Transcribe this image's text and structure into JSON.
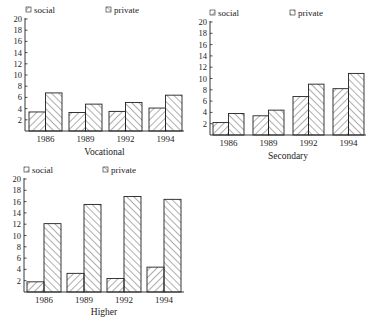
{
  "chart_data": [
    {
      "type": "bar",
      "title": "Vocational",
      "xlabel": "Vocational",
      "ylabel": "",
      "categories": [
        "1986",
        "1989",
        "1992",
        "1994"
      ],
      "series": [
        {
          "name": "social",
          "values": [
            3.4,
            3.3,
            3.5,
            4.1
          ]
        },
        {
          "name": "private",
          "values": [
            6.8,
            4.8,
            5.1,
            6.4
          ]
        }
      ],
      "ylim": [
        0,
        20
      ],
      "yticks": [
        2,
        4,
        6,
        8,
        10,
        12,
        14,
        16,
        18,
        20
      ],
      "legend": [
        "social",
        "private"
      ],
      "legend_position": "top",
      "grid": false
    },
    {
      "type": "bar",
      "title": "Secondary",
      "xlabel": "Secondary",
      "ylabel": "",
      "categories": [
        "1986",
        "1989",
        "1992",
        "1994"
      ],
      "series": [
        {
          "name": "social",
          "values": [
            2.2,
            3.4,
            6.8,
            8.2
          ]
        },
        {
          "name": "private",
          "values": [
            3.8,
            4.4,
            9.0,
            10.9
          ]
        }
      ],
      "ylim": [
        0,
        20
      ],
      "yticks": [
        2,
        4,
        6,
        8,
        10,
        12,
        14,
        16,
        18,
        20
      ],
      "legend": [
        "social",
        "private"
      ],
      "legend_position": "top",
      "grid": false
    },
    {
      "type": "bar",
      "title": "Higher",
      "xlabel": "Higher",
      "ylabel": "",
      "categories": [
        "1986",
        "1989",
        "1992",
        "1994"
      ],
      "series": [
        {
          "name": "social",
          "values": [
            1.8,
            3.3,
            2.4,
            4.4
          ]
        },
        {
          "name": "private",
          "values": [
            12.1,
            15.5,
            16.9,
            16.4
          ]
        }
      ],
      "ylim": [
        0,
        20
      ],
      "yticks": [
        2,
        4,
        6,
        8,
        10,
        12,
        14,
        16,
        18,
        20
      ],
      "legend": [
        "social",
        "private"
      ],
      "legend_position": "top",
      "grid": false
    }
  ],
  "layout": [
    {
      "x0": 25,
      "ybase": 131,
      "ytop": 19,
      "xend": 184,
      "groupStart": 29,
      "groupStep": 40,
      "barW": 16.5,
      "legendY": 13,
      "legendSocialX": 26,
      "legendPrivateX": 106,
      "catY": 142,
      "titleY": 155
    },
    {
      "x0": 210,
      "ybase": 135,
      "ytop": 22,
      "xend": 366,
      "groupStart": 213,
      "groupStep": 40,
      "barW": 15.5,
      "legendY": 16,
      "legendSocialX": 210,
      "legendPrivateX": 290,
      "catY": 146,
      "titleY": 159
    },
    {
      "x0": 24,
      "ybase": 292,
      "ytop": 179,
      "xend": 184,
      "groupStart": 27,
      "groupStep": 40,
      "barW": 17,
      "legendY": 173,
      "legendSocialX": 24,
      "legendPrivateX": 103,
      "catY": 303,
      "titleY": 315
    }
  ],
  "colors": {
    "ink": "#222222",
    "background": "#ffffff"
  }
}
